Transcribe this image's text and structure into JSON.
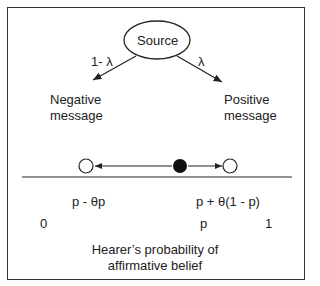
{
  "diagram": {
    "source_label": "Source",
    "left_branch_prob": "1- λ",
    "right_branch_prob": "λ",
    "negative_message": [
      "Negative",
      "message"
    ],
    "positive_message": [
      "Positive",
      "message"
    ],
    "lower_label": "p - θp",
    "upper_label": "p + θ(1 - p)",
    "axis_ticks": {
      "zero": "0",
      "p": "p",
      "one": "1"
    },
    "axis_title": [
      "Hearer’s probability of",
      "affirmative belief"
    ]
  }
}
